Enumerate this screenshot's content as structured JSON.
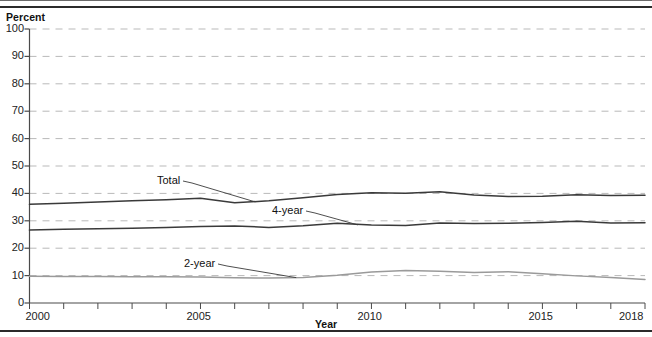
{
  "figure": {
    "y_axis_unit_label": "Percent",
    "x_axis_title": "Year"
  },
  "annotations": {
    "total": "Total",
    "four_year": "4-year",
    "two_year": "2-year"
  },
  "chart_data": {
    "type": "line",
    "title": "",
    "subtitle": "",
    "xlabel": "Year",
    "ylabel": "Percent",
    "xlim": [
      2000,
      2018
    ],
    "ylim": [
      0,
      100
    ],
    "grid": "horizontal-dashed",
    "legend": "inline-annotations",
    "y_ticks": [
      0,
      10,
      20,
      30,
      40,
      50,
      60,
      70,
      80,
      90,
      100
    ],
    "y_tick_labels": [
      "0",
      "10",
      "20",
      "30",
      "40",
      "50",
      "60",
      "70",
      "80",
      "90",
      "100"
    ],
    "x_ticks": [
      2000,
      2001,
      2002,
      2003,
      2004,
      2005,
      2006,
      2007,
      2008,
      2009,
      2010,
      2011,
      2012,
      2013,
      2014,
      2015,
      2016,
      2017,
      2018
    ],
    "x_tick_labels_shown": [
      "2000",
      "2005",
      "2010",
      "2015",
      "2018"
    ],
    "x": [
      2000,
      2001,
      2002,
      2003,
      2004,
      2005,
      2006,
      2007,
      2008,
      2009,
      2010,
      2011,
      2012,
      2013,
      2014,
      2015,
      2016,
      2017,
      2018
    ],
    "series": [
      {
        "name": "Total",
        "color": "#3a3a3a",
        "values": [
          36.0,
          36.4,
          36.9,
          37.3,
          37.7,
          38.2,
          36.6,
          37.3,
          38.4,
          39.6,
          40.2,
          40.1,
          40.6,
          39.4,
          38.9,
          39.0,
          39.5,
          39.2,
          39.3
        ]
      },
      {
        "name": "4-year",
        "color": "#3a3a3a",
        "values": [
          26.6,
          26.9,
          27.1,
          27.3,
          27.6,
          27.9,
          28.1,
          27.6,
          28.2,
          29.1,
          28.5,
          28.3,
          29.2,
          29.0,
          29.1,
          29.4,
          29.8,
          29.2,
          29.3
        ]
      },
      {
        "name": "2-year",
        "color": "#9a9a9a",
        "values": [
          9.8,
          9.7,
          9.7,
          9.6,
          9.6,
          9.5,
          9.2,
          9.1,
          9.3,
          10.1,
          11.3,
          11.9,
          11.6,
          11.1,
          11.4,
          10.7,
          9.9,
          9.3,
          8.6
        ]
      }
    ],
    "annotation_points": [
      {
        "label": "Total",
        "x": 2006.5,
        "y": 38.0
      },
      {
        "label": "4-year",
        "x": 2011.0,
        "y": 31.4
      },
      {
        "label": "2-year",
        "x": 2007.7,
        "y": 14.6
      }
    ]
  }
}
